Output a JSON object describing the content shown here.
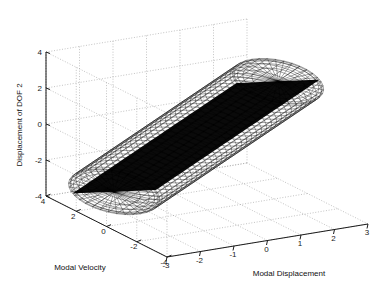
{
  "figure": {
    "background_color": "#ffffff",
    "line_color": "#1c1c1c",
    "grid_color": "#9a9a9a",
    "surface_color": "#000000"
  },
  "chart_data": {
    "type": "scatter",
    "title": "",
    "subtitle": "",
    "plot_style": "matlab-3d-mesh-surface",
    "xlabel": "Modal Displacement",
    "ylabel": "Modal Velocity",
    "zlabel": "Displacement of DOF 2",
    "xlim": [
      -3,
      3
    ],
    "ylim": [
      -4,
      4
    ],
    "zlim": [
      -4,
      4
    ],
    "xticks": [
      -3,
      -2,
      -1,
      0,
      1,
      2,
      3
    ],
    "yticks": [
      4,
      2,
      0,
      -2,
      -4
    ],
    "zticks": [
      -4,
      -2,
      0,
      2,
      4
    ],
    "xticklabels": [
      "-3",
      "-2",
      "-1",
      "0",
      "1",
      "2",
      "3"
    ],
    "yticklabels": [
      "4",
      "2",
      "0",
      "-2",
      "-4"
    ],
    "zticklabels": [
      "-4",
      "-2",
      "0",
      "2",
      "4"
    ],
    "grid": true,
    "legend": false,
    "legend_position": "none",
    "view": {
      "azimuth": -37.5,
      "elevation": 30
    },
    "surface": {
      "shape": "capsule",
      "description": "Dense black wireframe capsule (cylinder with hemispherical caps) tilted diagonally across the axes",
      "axis_start": [
        -1.6,
        2.6,
        -3.6
      ],
      "axis_end": [
        1.4,
        -1.6,
        3.4
      ],
      "radius": 1.45,
      "mesh_u_divisions": 44,
      "mesh_v_divisions": 34,
      "edge_color": "#000000",
      "face_color": "#0a0a0a"
    },
    "annotations": []
  },
  "axis_labels": {
    "x": "Modal Displacement",
    "y": "Modal Velocity",
    "z": "Displacement of DOF 2"
  }
}
